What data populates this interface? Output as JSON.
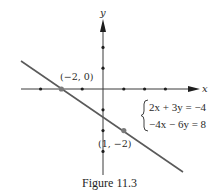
{
  "figure": {
    "caption": "Figure 11.3",
    "axes": {
      "x_label": "x",
      "y_label": "y",
      "origin_px": [
        103,
        89
      ],
      "unit_px": 20.8,
      "x_ticks": [
        -3,
        -2,
        -1,
        1,
        2,
        3
      ],
      "y_ticks": [
        2,
        1,
        -1,
        -2,
        -3
      ]
    },
    "line": {
      "from_px": [
        21,
        61
      ],
      "to_px": [
        183,
        172
      ],
      "color": "#5a5a5a"
    },
    "points": [
      {
        "label": "(−2, 0)",
        "x": -2,
        "y": 0
      },
      {
        "label": "(1, −2)",
        "x": 1,
        "y": -2
      }
    ],
    "system": {
      "eq1": "2x + 3y = −4",
      "eq2": "−4x − 6y = 8"
    }
  }
}
